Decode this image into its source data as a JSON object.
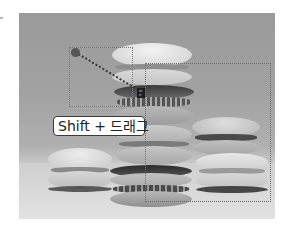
{
  "screenshot": {
    "description": "Photo of stacked macarons with a marquee selection being dragged while holding Shift",
    "photo": {
      "subject": "macarons",
      "colors": {
        "background": "#a0a0a0",
        "table": "#dcdcdc",
        "shell_light": "#e4e4e4",
        "shell_mid": "#c8c8c8",
        "filling": "#4a4a4a"
      }
    },
    "overlay": {
      "hint_label": "Shift + 드래그",
      "readout": [
        "W:",
        "H:"
      ],
      "selection_color": "#6e6e6e",
      "anchor_color": "#555555"
    },
    "icons": {
      "anchor": "drag-start-point-icon",
      "marquee": "marquee-selection-icon"
    }
  }
}
